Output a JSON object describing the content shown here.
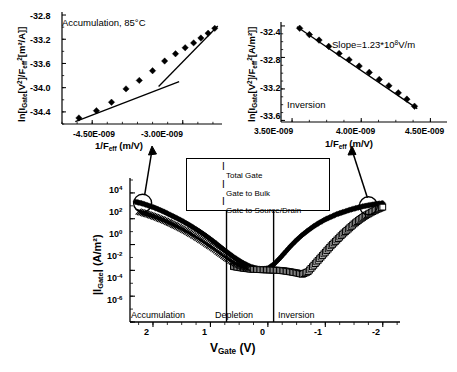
{
  "figure": {
    "title": "",
    "background": "#ffffff",
    "foreground": "#000000"
  },
  "inset_left": {
    "name": "accumulation-inset",
    "annotation": "Accumulation, 85°C",
    "ylabel_parts": {
      "pre": "ln[I",
      "sub1": "Gate",
      "mid": "[V",
      "sup1": "2",
      "mid2": "]/F",
      "sub2": "eff",
      "sup2": "2",
      "post": "[m²/A]]"
    },
    "ylabel_plain": "ln[IGate[V²]/Feff²[m²/A]]",
    "xlabel_plain": "1/Feff (m/V)",
    "xlabel_parts": {
      "pre": "1/F",
      "sub": "eff",
      "post": " (m/V)"
    },
    "yticks": [
      "-32.8",
      "-33.2",
      "-33.6",
      "-34.0",
      "-34.4"
    ],
    "ytick_values": [
      -32.8,
      -33.2,
      -33.6,
      -34.0,
      -34.4
    ],
    "xticks": [
      "-4.50E-009",
      "-3.00E-009"
    ],
    "xtick_values": [
      -4.5e-09,
      -3e-09
    ]
  },
  "inset_right": {
    "name": "inversion-inset",
    "annotation": "Inversion",
    "slope_label": {
      "pre": "Slope=1.23*10",
      "sup": "8",
      "post": "V/m"
    },
    "slope_plain": "Slope=1.23*10^8 V/m",
    "ylabel_plain": "ln[IGate[V²]/Feff²[A/m²]]",
    "ylabel_parts": {
      "pre": "ln[I",
      "sub1": "Gate",
      "mid": "[V",
      "sup1": "2",
      "mid2": "]/F",
      "sub2": "eff",
      "sup2": "2",
      "post": "[A/m²]]"
    },
    "xlabel_plain": "1/Feff (m/V)",
    "xlabel_parts": {
      "pre": "1/F",
      "sub": "eff",
      "post": " (m/V)"
    },
    "yticks": [
      "-32.4",
      "-32.8",
      "-33.2",
      "-33.6"
    ],
    "ytick_values": [
      -32.4,
      -32.8,
      -33.2,
      -33.6
    ],
    "xticks": [
      "3.50E-009",
      "4.00E-009",
      "4.50E-009"
    ],
    "xtick_values": [
      3.5e-09,
      4e-09,
      4.5e-09
    ]
  },
  "legend": {
    "name": "series-legend",
    "items": [
      {
        "marker": "filled-diamond",
        "symbol": "I",
        "sub": "Total Gate"
      },
      {
        "marker": "open-square",
        "symbol": "I",
        "sub": "Gate to Bulk"
      },
      {
        "marker": "cross",
        "symbol": "I",
        "sub": "Gate to Source/Drain"
      }
    ]
  },
  "main_plot": {
    "name": "gate-current-plot",
    "ylabel_parts": {
      "pre": "|I",
      "sub": "Gate",
      "post": "| (A/m²)"
    },
    "ylabel_plain": "|IGate| (A/m²)",
    "xlabel_parts": {
      "pre": "V",
      "sub": "Gate",
      "post": " (V)"
    },
    "xlabel_plain": "VGate (V)",
    "yticks": [
      "10",
      "10",
      "10",
      "10",
      "10",
      "10"
    ],
    "ytick_exponents": [
      "4",
      "2",
      "0",
      "-2",
      "-4",
      "-6"
    ],
    "xticks": [
      "2",
      "1",
      "0",
      "-1",
      "-2"
    ],
    "xtick_values": [
      2,
      1,
      0,
      -1,
      -2
    ],
    "regions": [
      {
        "label": "Accumulation",
        "from": 2.4,
        "to": 0.72
      },
      {
        "label": "Depletion",
        "from": 0.72,
        "to": -0.1
      },
      {
        "label": "Inversion",
        "from": -0.1,
        "to": -2.3
      }
    ]
  },
  "chart_data": [
    {
      "type": "scatter",
      "id": "accumulation-inset",
      "title": "Accumulation, 85°C",
      "xlabel": "1/F_eff (m/V)",
      "ylabel": "ln[I_Gate[V^2]/F_eff^2[m^2/A]]",
      "xlim": [
        -5e-09,
        -2.35e-09
      ],
      "ylim": [
        -34.6,
        -32.75
      ],
      "xticks": [
        -4.5e-09,
        -3e-09
      ],
      "yticks": [
        -32.8,
        -33.2,
        -33.6,
        -34.0,
        -34.4
      ],
      "grid": false,
      "legend": "none",
      "series": [
        {
          "name": "data",
          "marker": "filled-diamond",
          "x": [
            -4.72e-09,
            -4.43e-09,
            -4.18e-09,
            -3.94e-09,
            -3.72e-09,
            -3.5e-09,
            -3.3e-09,
            -3.12e-09,
            -2.96e-09,
            -2.82e-09,
            -2.7e-09,
            -2.58e-09,
            -2.47e-09
          ],
          "y": [
            -34.5,
            -34.38,
            -34.24,
            -34.02,
            -33.88,
            -33.72,
            -33.56,
            -33.44,
            -33.34,
            -33.26,
            -33.18,
            -33.1,
            -33.02
          ]
        },
        {
          "name": "fit-line",
          "type": "line",
          "x": [
            -4.78e-09,
            -3.06e-09
          ],
          "y": [
            -34.56,
            -33.9
          ]
        },
        {
          "name": "fit-line-upper",
          "type": "line",
          "x": [
            -3.4e-09,
            -2.42e-09
          ],
          "y": [
            -33.98,
            -32.98
          ]
        }
      ]
    },
    {
      "type": "scatter",
      "id": "inversion-inset",
      "title": "Inversion",
      "annotation": "Slope=1.23*10^8 V/m",
      "xlabel": "1/F_eff (m/V)",
      "ylabel": "ln[I_Gate[V^2]/F_eff^2[A/m^2]]",
      "xlim": [
        3.42e-09,
        4.62e-09
      ],
      "ylim": [
        -33.62,
        -32.35
      ],
      "xticks": [
        3.5e-09,
        4e-09,
        4.5e-09
      ],
      "yticks": [
        -32.4,
        -32.8,
        -33.2,
        -33.6
      ],
      "grid": false,
      "legend": "none",
      "series": [
        {
          "name": "data",
          "marker": "filled-diamond",
          "x": [
            3.555e-09,
            3.625e-09,
            3.695e-09,
            3.765e-09,
            3.84e-09,
            3.912e-09,
            3.985e-09,
            4.058e-09,
            4.13e-09,
            4.2e-09,
            4.268e-09,
            4.33e-09,
            4.385e-09
          ],
          "y": [
            -32.43,
            -32.51,
            -32.58,
            -32.66,
            -32.75,
            -32.83,
            -32.91,
            -32.99,
            -33.08,
            -33.16,
            -33.25,
            -33.33,
            -33.42
          ]
        },
        {
          "name": "fit-line",
          "type": "line",
          "x": [
            3.535e-09,
            4.405e-09
          ],
          "y": [
            -32.41,
            -33.45
          ]
        }
      ]
    },
    {
      "type": "line",
      "id": "gate-current-plot",
      "xlabel": "V_Gate (V)",
      "ylabel": "|I_Gate| (A/m^2)",
      "xlim": [
        2.4,
        -2.3
      ],
      "ylim_log10": [
        -6,
        5
      ],
      "xticks": [
        2,
        1,
        0,
        -1,
        -2
      ],
      "yticks_log10": [
        4,
        2,
        0,
        -2,
        -4,
        -6
      ],
      "x_axis_inverted": true,
      "y_scale": "log",
      "grid": false,
      "legend": "top-center",
      "series": [
        {
          "name": "I Total Gate",
          "marker": "filled-diamond",
          "x": [
            2.3,
            2.2,
            2.1,
            2.0,
            1.9,
            1.8,
            1.7,
            1.6,
            1.5,
            1.4,
            1.3,
            1.2,
            1.1,
            1.0,
            0.9,
            0.8,
            0.7,
            0.6,
            0.5,
            0.4,
            0.3,
            0.2,
            0.1,
            0.0,
            -0.1,
            -0.2,
            -0.3,
            -0.4,
            -0.5,
            -0.6,
            -0.7,
            -0.8,
            -0.9,
            -1.0,
            -1.1,
            -1.2,
            -1.3,
            -1.4,
            -1.5,
            -1.6,
            -1.7,
            -1.8,
            -1.9,
            -2.0
          ],
          "y_log10": [
            3.3,
            3.2,
            3.05,
            2.9,
            2.72,
            2.52,
            2.3,
            2.08,
            1.85,
            1.6,
            1.33,
            1.05,
            0.75,
            0.42,
            0.08,
            -0.28,
            -0.62,
            -0.95,
            -1.25,
            -1.5,
            -1.72,
            -1.85,
            -1.9,
            -1.85,
            -1.55,
            -1.1,
            -0.6,
            -0.1,
            0.35,
            0.75,
            1.1,
            1.42,
            1.7,
            1.95,
            2.15,
            2.35,
            2.5,
            2.65,
            2.78,
            2.9,
            3.0,
            3.08,
            3.15,
            3.2
          ]
        },
        {
          "name": "I Gate to Bulk",
          "marker": "open-square",
          "x": [
            0.6,
            0.5,
            0.4,
            0.3,
            0.2,
            0.1,
            0.0,
            -0.1,
            -0.2,
            -0.3,
            -0.4,
            -0.5,
            -0.6,
            -0.7,
            -0.8,
            -0.9,
            -1.0,
            -1.1,
            -1.2,
            -1.3,
            -1.4,
            -1.5,
            -1.6,
            -1.7,
            -1.8,
            -1.9,
            -2.0
          ],
          "y_log10": [
            -1.7,
            -1.78,
            -1.85,
            -1.9,
            -1.93,
            -1.95,
            -1.96,
            -1.98,
            -2.0,
            -2.05,
            -2.12,
            -2.2,
            -2.3,
            -2.1,
            -1.6,
            -1.1,
            -0.6,
            -0.1,
            0.35,
            0.8,
            1.2,
            1.6,
            1.95,
            2.25,
            2.5,
            2.72,
            2.9
          ]
        },
        {
          "name": "I Gate to Source/Drain",
          "marker": "cross",
          "x": [
            2.25,
            2.15,
            2.05,
            1.95,
            1.85,
            1.75,
            1.65,
            1.55,
            1.45,
            1.35,
            1.25,
            1.15,
            1.05,
            0.95,
            0.85,
            0.75,
            0.65,
            0.55,
            0.45,
            0.35
          ],
          "y_log10": [
            2.55,
            2.42,
            2.28,
            2.12,
            1.95,
            1.76,
            1.55,
            1.33,
            1.1,
            0.85,
            0.58,
            0.3,
            0.0,
            -0.3,
            -0.62,
            -0.95,
            -1.25,
            -1.5,
            -1.7,
            -1.85
          ]
        }
      ],
      "circled_regions": [
        {
          "name": "accumulation-callout",
          "x": 2.18,
          "y_log10": 3.2
        },
        {
          "name": "inversion-callout",
          "x": -1.75,
          "y_log10": 3.0
        }
      ]
    }
  ]
}
